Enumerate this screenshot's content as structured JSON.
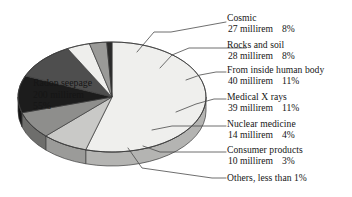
{
  "chart_data": {
    "type": "pie",
    "title": "",
    "subtitle": "",
    "xlabel": "",
    "ylabel": "",
    "unit": "millirem",
    "legend_position": "callout-right",
    "grid": false,
    "total_millirem": 358,
    "categories": [
      "Radon seepage",
      "Cosmic",
      "Rocks and soil",
      "From inside human body",
      "Medical X rays",
      "Nuclear medicine",
      "Consumer products",
      "Others, less than 1%"
    ],
    "values": [
      200,
      27,
      28,
      40,
      39,
      14,
      10,
      1
    ],
    "percent": [
      55,
      8,
      8,
      11,
      11,
      4,
      3,
      0.9
    ],
    "slices": [
      {
        "name": "Radon seepage",
        "label": "Radon seepage",
        "amount": "200 millirem",
        "percent_text": "55%",
        "value": 200,
        "percent": 55,
        "color": "#efefed",
        "side_color": "#b4b4b2",
        "label_placement": "inside"
      },
      {
        "name": "Cosmic",
        "label": "Cosmic",
        "amount": "27 millirem",
        "percent_text": "8%",
        "value": 27,
        "percent": 8,
        "color": "#c9c9c7",
        "side_color": "#9b9b99",
        "label_placement": "callout"
      },
      {
        "name": "Rocks and soil",
        "label": "Rocks and soil",
        "amount": "28 millirem",
        "percent_text": "8%",
        "value": 28,
        "percent": 8,
        "color": "#8e8e8c",
        "side_color": "#6e6e6c",
        "label_placement": "callout"
      },
      {
        "name": "From inside human body",
        "label": "From inside human body",
        "amount": "40 millirem",
        "percent_text": "11%",
        "value": 40,
        "percent": 11,
        "color": "#1c1c1c",
        "side_color": "#141414",
        "label_placement": "callout"
      },
      {
        "name": "Medical X rays",
        "label": "Medical X rays",
        "amount": "39 millirem",
        "percent_text": "11%",
        "value": 39,
        "percent": 11,
        "color": "#4e4e4e",
        "side_color": "#3b3b3b",
        "label_placement": "callout"
      },
      {
        "name": "Nuclear medicine",
        "label": "Nuclear medicine",
        "amount": "14 millirem",
        "percent_text": "4%",
        "value": 14,
        "percent": 4,
        "color": "#eeeeec",
        "side_color": "#bdbdbb",
        "label_placement": "callout"
      },
      {
        "name": "Consumer products",
        "label": "Consumer products",
        "amount": "10 millirem",
        "percent_text": "3%",
        "value": 10,
        "percent": 3,
        "color": "#9a9a98",
        "side_color": "#757573",
        "label_placement": "callout"
      },
      {
        "name": "Others",
        "label": "Others, less than 1%",
        "amount": "",
        "percent_text": "",
        "value": 1,
        "percent": 0.9,
        "color": "#2a2a2a",
        "side_color": "#1f1f1f",
        "label_placement": "callout"
      }
    ],
    "style": {
      "outline_color": "#3a3a3a",
      "leader_color": "#4a4a4a",
      "background": "#ffffff"
    }
  }
}
